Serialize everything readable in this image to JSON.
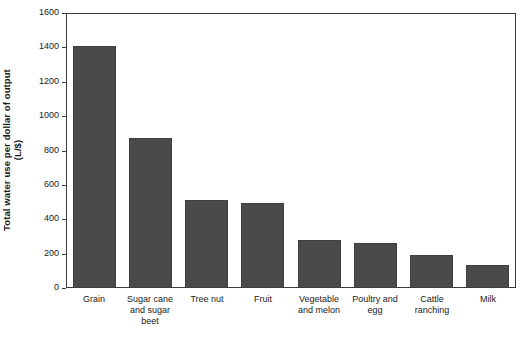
{
  "chart_data": {
    "type": "bar",
    "title": "",
    "xlabel": "",
    "ylabel": "Total water use per dollar of output (L/$)",
    "ylabel_line1": "Total water use per dollar of output",
    "ylabel_line2": "(L/$)",
    "ylim": [
      0,
      1600
    ],
    "yticks": [
      0,
      200,
      400,
      600,
      800,
      1000,
      1200,
      1400,
      1600
    ],
    "ytick_labels": [
      "0",
      "200",
      "400",
      "600",
      "800",
      "1000",
      "1200",
      "1400",
      "1600"
    ],
    "grid": false,
    "legend": false,
    "legend_position": "none",
    "bar_color": "#4a4a4a",
    "categories": [
      "Grain",
      "Sugar cane and sugar beet",
      "Tree nut",
      "Fruit",
      "Vegetable and melon",
      "Poultry and egg",
      "Cattle ranching",
      "Milk"
    ],
    "category_lines": [
      [
        "Grain"
      ],
      [
        "Sugar cane",
        "and sugar",
        "beet"
      ],
      [
        "Tree nut"
      ],
      [
        "Fruit"
      ],
      [
        "Vegetable",
        "and melon"
      ],
      [
        "Poultry and",
        "egg"
      ],
      [
        "Cattle",
        "ranching"
      ],
      [
        "Milk"
      ]
    ],
    "values": [
      1410,
      870,
      512,
      495,
      280,
      262,
      190,
      135
    ]
  }
}
